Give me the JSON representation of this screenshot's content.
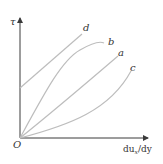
{
  "diagram": {
    "title": "",
    "type": "rheology curves (shear stress vs. velocity gradient)",
    "axes": {
      "y_label": "τ",
      "x_label_main": "du",
      "x_label_sub": "x",
      "x_label_tail": "/dy",
      "origin_label": "O"
    },
    "curves": [
      {
        "id": "d",
        "label": "d",
        "shape": "straight line with positive intercept"
      },
      {
        "id": "b",
        "label": "b",
        "shape": "concave down from origin"
      },
      {
        "id": "a",
        "label": "a",
        "shape": "straight line from origin"
      },
      {
        "id": "c",
        "label": "c",
        "shape": "concave up from origin"
      }
    ],
    "colors": {
      "axis": "#3a3a3a",
      "curve": "#bdbdbd",
      "text": "#333333"
    }
  }
}
